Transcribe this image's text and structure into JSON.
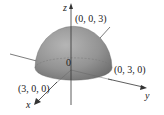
{
  "diagram": {
    "type": "3d-hemisphere",
    "axes": {
      "x": "x",
      "y": "y",
      "z": "z"
    },
    "origin_label": "0",
    "points": [
      {
        "label": "(0, 0, 3)",
        "position": "top of z-axis intercept"
      },
      {
        "label": "(0, 3, 0)",
        "position": "y-axis intercept"
      },
      {
        "label": "(3, 0, 0)",
        "position": "x-axis intercept"
      }
    ],
    "radius": 3,
    "colors": {
      "surface": "#8f8f8f",
      "axis": "#333333",
      "background": "#ffffff"
    }
  }
}
